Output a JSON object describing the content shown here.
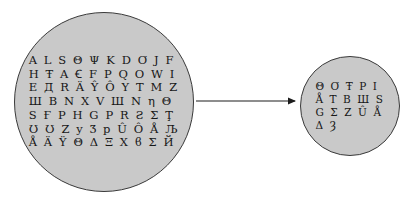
{
  "diagram": {
    "type": "set-mapping",
    "background_color": "#ffffff",
    "circle_fill_color": "#c9c9c9",
    "circle_stroke_color": "#3a3a3a",
    "symbol_color": "#171717",
    "arrow_color": "#1c1c1c"
  },
  "source_set": {
    "name": "source-symbol-set",
    "rows": [
      "A L S Θ Ψ K D Ơ J F",
      "H Ŧ A Ꞓ F P Q O W I",
      "E Д R Ä Ŷ Ô Y T M Z",
      "Ш B N X V Ш N η Θ",
      "S Ғ P H G P R Ƨ Σ Ţ",
      "Ʊ Ʊ Z y Ʒ p Û Ô Å Љ",
      "Å Ä Ÿ Θ Δ Ξ X ϐ Σ Й"
    ],
    "row_count": 7,
    "symbol_count": 69
  },
  "target_set": {
    "name": "target-symbol-set",
    "rows": [
      "Θ Ơ Ŧ P I",
      "Å T B Ш S",
      "G Σ Z Û Å",
      "Δ Ȝ"
    ],
    "row_count": 4,
    "symbol_count": 17
  },
  "arrow": {
    "name": "mapping-arrow",
    "direction": "left-to-right",
    "from": "source-circle",
    "to": "target-circle",
    "x1": 196,
    "y1": 101,
    "x2": 297,
    "y2": 101
  }
}
